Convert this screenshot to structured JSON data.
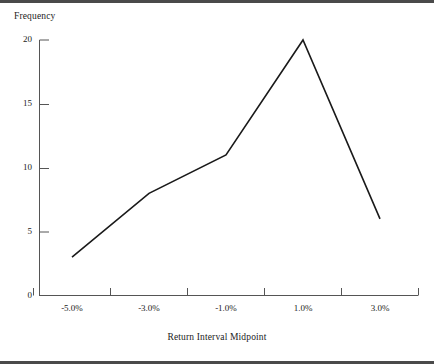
{
  "chart_data": {
    "type": "line",
    "title": "",
    "subtitle": "",
    "xlabel": "Return Interval Midpoint",
    "ylabel": "Frequency",
    "categories": [
      "-5.0%",
      "-3.0%",
      "-1.0%",
      "1.0%",
      "3.0%"
    ],
    "values": [
      3,
      8,
      11,
      20,
      6
    ],
    "series": [
      {
        "name": "Frequency",
        "values": [
          3,
          8,
          11,
          20,
          6
        ]
      }
    ],
    "ylim": [
      0,
      20
    ],
    "y_ticks": [
      0,
      5,
      10,
      15,
      20
    ],
    "y_tick_labels": [
      "0",
      "5",
      "10",
      "15",
      "20"
    ],
    "x_tick_labels": [
      "-5.0%",
      "-3.0%",
      "-1.0%",
      "1.0%",
      "3.0%"
    ],
    "x_axis_boundaries": [
      "-6.0%",
      "-4.0%",
      "-2.0%",
      "0.0%",
      "2.0%",
      "4.0%"
    ],
    "grid": false,
    "legend": "none",
    "line_color": "#1a1a1a",
    "axis_color": "#555555",
    "background_color": "#ffffff"
  },
  "labels": {
    "y_axis_title": "Frequency",
    "x_axis_title": "Return Interval Midpoint"
  }
}
